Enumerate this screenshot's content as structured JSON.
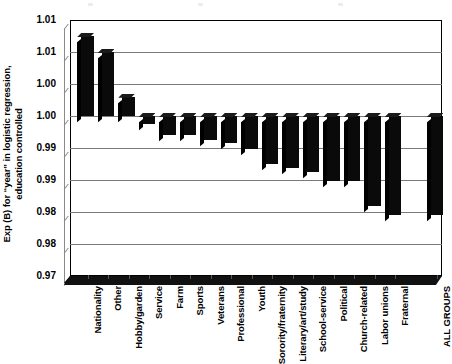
{
  "chart_data": {
    "type": "bar",
    "title": "",
    "xlabel": "",
    "ylabel": "Exp (B) for “year” in logistic regression, education controlled",
    "ylabel_line1": "Exp (B) for “year” in logistic regression,",
    "ylabel_line2": "education controlled",
    "ylim": [
      0.975,
      1.015
    ],
    "baseline": 1.0,
    "grid": true,
    "legend": "none",
    "ytick_values": [
      1.015,
      1.01,
      1.005,
      1.0,
      0.995,
      0.99,
      0.985,
      0.98,
      0.975
    ],
    "ytick_labels": [
      "1.01",
      "1.01",
      "1.00",
      "1.00",
      "0.99",
      "0.99",
      "0.98",
      "0.98",
      "0.97"
    ],
    "categories": [
      "Nationality",
      "Other",
      "Hobby/garden",
      "Service",
      "Farm",
      "Sports",
      "Veterans",
      "Professional",
      "Youth",
      "Sorority/fraternity",
      "Literary/art/study",
      "School-service",
      "Political",
      "Church-related",
      "Labor unions",
      "Fraternal",
      "ALL GROUPS"
    ],
    "values": [
      1.0125,
      1.01,
      1.003,
      0.9988,
      0.997,
      0.997,
      0.9962,
      0.9958,
      0.9948,
      0.9925,
      0.9918,
      0.9912,
      0.9898,
      0.9898,
      0.986,
      0.9845,
      0.9845
    ],
    "bar_color": "#0a0a0a",
    "grid_color": "#7a7a7a",
    "axis_color": "#000000",
    "note": "Bar 17 (ALL GROUPS) separated by a gap from the category bars"
  }
}
